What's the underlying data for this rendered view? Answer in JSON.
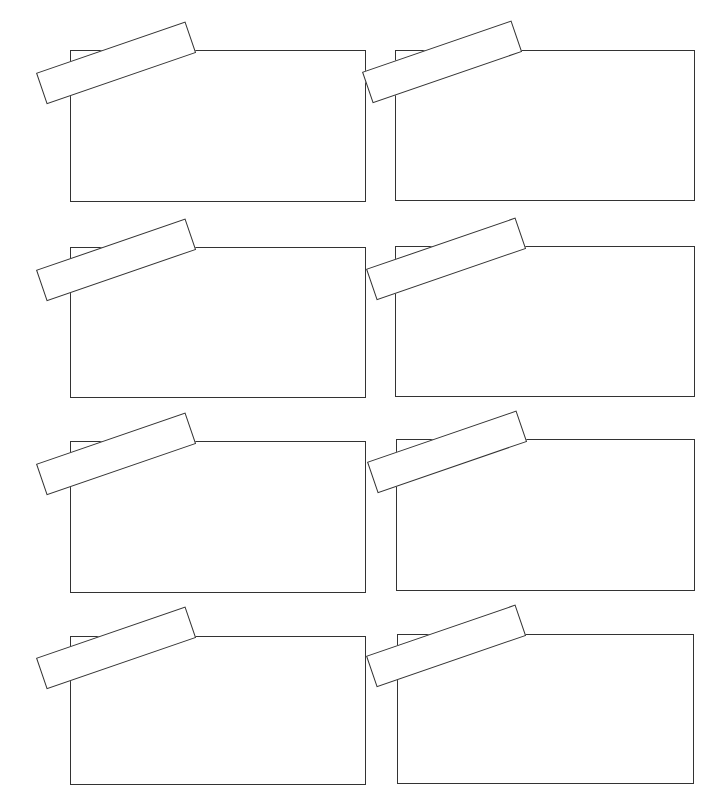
{
  "page": {
    "stroke_color": "#333333",
    "background_color": "#ffffff"
  },
  "frames": [
    {
      "id": "frame-1",
      "row": 1,
      "col": 1,
      "x": 70,
      "y": 50,
      "w": 296,
      "h": 152,
      "tape": {
        "x": 36,
        "y": 73
      }
    },
    {
      "id": "frame-2",
      "row": 1,
      "col": 2,
      "x": 395,
      "y": 50,
      "w": 300,
      "h": 151,
      "tape": {
        "x": 362,
        "y": 72
      }
    },
    {
      "id": "frame-3",
      "row": 2,
      "col": 1,
      "x": 70,
      "y": 247,
      "w": 296,
      "h": 151,
      "tape": {
        "x": 36,
        "y": 270
      }
    },
    {
      "id": "frame-4",
      "row": 2,
      "col": 2,
      "x": 395,
      "y": 246,
      "w": 300,
      "h": 151,
      "tape": {
        "x": 366,
        "y": 269
      }
    },
    {
      "id": "frame-5",
      "row": 3,
      "col": 1,
      "x": 70,
      "y": 441,
      "w": 296,
      "h": 152,
      "tape": {
        "x": 36,
        "y": 464
      }
    },
    {
      "id": "frame-6",
      "row": 3,
      "col": 2,
      "x": 396,
      "y": 439,
      "w": 299,
      "h": 152,
      "tape": {
        "x": 367,
        "y": 462
      }
    },
    {
      "id": "frame-7",
      "row": 4,
      "col": 1,
      "x": 70,
      "y": 636,
      "w": 296,
      "h": 149,
      "tape": {
        "x": 36,
        "y": 658
      }
    },
    {
      "id": "frame-8",
      "row": 4,
      "col": 2,
      "x": 397,
      "y": 634,
      "w": 297,
      "h": 150,
      "tape": {
        "x": 366,
        "y": 656
      }
    }
  ]
}
